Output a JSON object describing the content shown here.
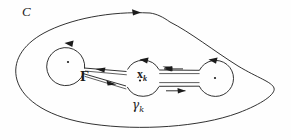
{
  "figure": {
    "background_color": "#fefefe",
    "stroke_color": "#1b1b1b",
    "labels": {
      "outer_contour": "C",
      "cut_left": "Γ",
      "singular_point_main": "x",
      "singular_point_main_sub": "k",
      "small_circle_main": "γ",
      "small_circle_main_sub": "k"
    },
    "elements": {
      "outer_contour_name": "C",
      "left_circle_name": "left-small-circle",
      "middle_circle_name": "gamma-k-circle",
      "right_circle_name": "right-small-circle",
      "left_cut_name": "Gamma",
      "right_cut_name": "right-cut-channel"
    },
    "geometry": {
      "outer_arrow_direction": "clockwise-at-top",
      "left_circle_center": [
        68,
        62
      ],
      "left_circle_radius": 19,
      "middle_circle_center": [
        143,
        78
      ],
      "middle_circle_radius": 18,
      "right_circle_center": [
        215,
        78
      ],
      "right_circle_radius": 18,
      "left_cut_upper_arrow": "left",
      "left_cut_lower_arrow": "right",
      "right_cut_upper_arrow": "left",
      "right_cut_lower_arrow": "right",
      "circle_arrow_direction": "counterclockwise"
    },
    "points": {
      "left_dot": [
        68,
        62
      ],
      "middle_dot": [
        140,
        80
      ],
      "right_dot": [
        215,
        78
      ]
    }
  }
}
